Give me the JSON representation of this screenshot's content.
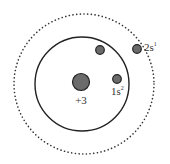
{
  "diagram": {
    "nucleus": {
      "label": "+3",
      "color": "#6b6b6b"
    },
    "shells": [
      {
        "name": "inner-shell",
        "style": "solid",
        "label": "1s",
        "superscript": "2",
        "electrons": 2
      },
      {
        "name": "outer-shell",
        "style": "dotted",
        "label": "2s",
        "superscript": "1",
        "electrons": 1
      }
    ],
    "colors": {
      "electron": "#6b6b6b",
      "electron_stroke": "#222222",
      "line": "#222222"
    }
  }
}
